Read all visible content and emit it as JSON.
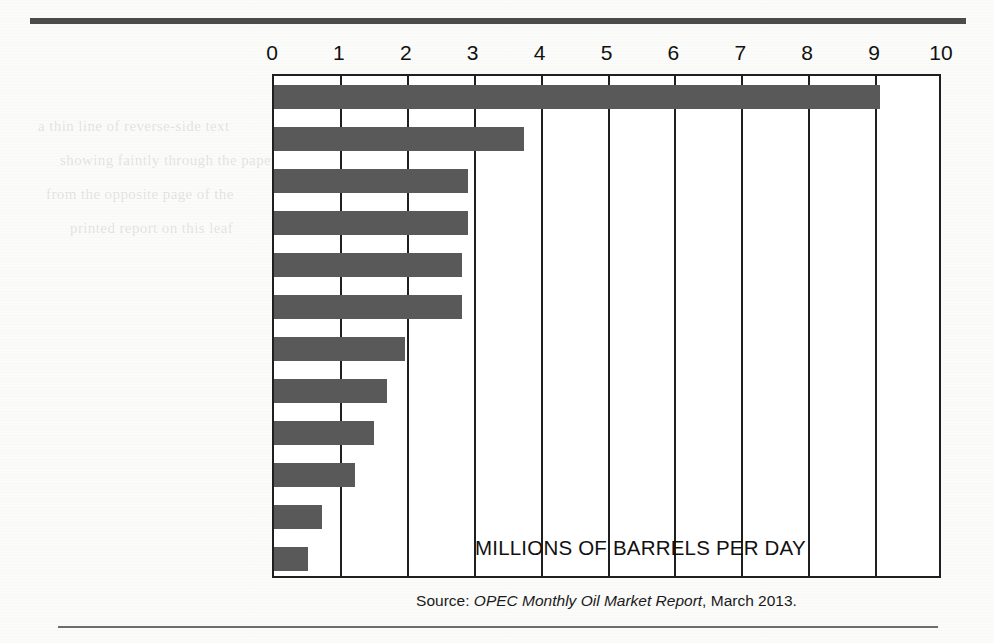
{
  "chart_data": {
    "type": "bar",
    "orientation": "horizontal",
    "title": "",
    "subtitle": "",
    "annotation": "MILLIONS OF BARRELS PER DAY",
    "xlabel": "",
    "ylabel": "",
    "xlim": [
      0,
      10
    ],
    "xticks": [
      "0",
      "1",
      "2",
      "3",
      "4",
      "5",
      "6",
      "7",
      "8",
      "9",
      "10"
    ],
    "grid": "vertical",
    "legend": "none",
    "bar_color": "#595959",
    "axis_color": "#1f1f1f",
    "categories": [
      "Saudi Arabia",
      "Iran",
      "Iraq",
      "Kuwait",
      "United Arab Emirates",
      "Venezuela",
      "Nigeria",
      "Angola",
      "Libya",
      "Algeria",
      "Qatar",
      "Ecuador"
    ],
    "values": [
      9.06,
      3.74,
      2.9,
      2.9,
      2.81,
      2.81,
      1.96,
      1.69,
      1.49,
      1.21,
      0.72,
      0.51
    ],
    "units": "millions of barrels per day"
  },
  "source": {
    "prefix": "Source: ",
    "publication": "OPEC Monthly Oil Market Report",
    "suffix": ", March 2013."
  },
  "bleed_text": [
    "a thin line of reverse-side text",
    "showing faintly through the paper",
    "from the opposite page of the",
    "printed report on this leaf",
    "continuing across the margin",
    "of the sheet as a ghost image"
  ]
}
